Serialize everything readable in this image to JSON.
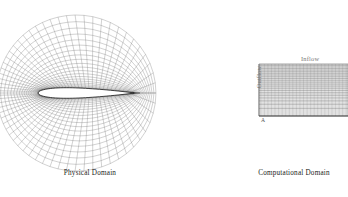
{
  "figure": {
    "background_color": "#ffffff",
    "mesh_color": "#5a5a5a",
    "airfoil_color": "#111111"
  },
  "physical": {
    "caption": "Physical Domain",
    "panel_name": "physical-domain",
    "mesh": {
      "type": "c-grid",
      "radial_cells": 22,
      "circumferential_cells": 64,
      "airfoil_chord_px": 96,
      "airfoil_thickness_ratio": 0.11,
      "far_field_radius_px": 78,
      "center_x": 86,
      "center_y": 93
    }
  },
  "computational": {
    "caption": "Computational Domain",
    "panel_name": "computational-domain",
    "labels": {
      "inflow": "Inflow",
      "outflow": "Outflow",
      "corner": "A"
    },
    "mesh": {
      "type": "rectangular",
      "x_cells": 64,
      "y_cells": 22,
      "left_px": 259,
      "top_px": 64,
      "width_px": 89,
      "height_px": 52
    }
  }
}
